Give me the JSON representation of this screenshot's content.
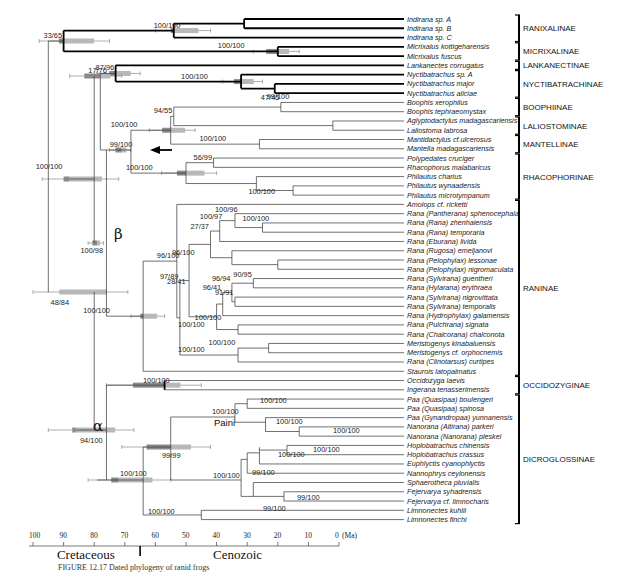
{
  "figure": {
    "caption_visible": "FIGURE 12.17  Dated phylogeny of ranid frogs",
    "axis": {
      "unit_label": "(Ma)",
      "ticks": [
        100,
        90,
        80,
        70,
        60,
        50,
        40,
        30,
        20,
        10,
        0
      ],
      "range_ma": [
        100,
        0
      ],
      "boundary_ma": 65,
      "eras": [
        {
          "name": "Cretaceous",
          "center_ma": 84
        },
        {
          "name": "Cenozoic",
          "center_ma": 33
        }
      ]
    },
    "colors": {
      "branch": "#333333",
      "bold_branch": "#000000",
      "hpd_bar": "#b8b8b8",
      "hpd_dark": "#8a8a8a",
      "whisker": "#999999"
    },
    "annotations": {
      "alpha": "α",
      "beta": "β",
      "paini": "Paini",
      "arrow": "left-arrow"
    },
    "taxa": [
      "Indirana sp. A",
      "Indirana sp. B",
      "Indirana sp. C",
      "Micrixalus kottigeharensis",
      "Micrixalus fuscus",
      "Lankanectes corrugatus",
      "Nyctibatrachus sp. A",
      "Nyctibatrachus major",
      "Nyctibatrachus aliciae",
      "Boophis xerophilus",
      "Boophis tephraeomystax",
      "Aglyptodactylus madagascariensis",
      "Laliostoma labrosa",
      "Mantidactylus cf.ulcerosus",
      "Mantella madagascariensis",
      "Polypedates cruciger",
      "Rhacophorus malabaricus",
      "Philautus charius",
      "Philautus wynaadensis",
      "Philautus microtympanum",
      "Amolops  cf. ricketti",
      "Rana (Pantherana) sphenocephala",
      "Rana (Rana) zhenhaiensis",
      "Rana (Rana) temporaria",
      "Rana (Eburana) livida",
      "Rana (Rugosa) emeljanovi",
      "Rana (Pelophylax) lessonae",
      "Rana (Pelophylax) nigromaculata",
      "Rana (Sylvirana) guentheri",
      "Rana (Hylarana) erythraea",
      "Rana (Sylvirana) nigrovittata",
      "Rana (Sylvirana) temporalis",
      "Rana (Hydrophylax) galamensis",
      "Rana (Pulchrana) signata",
      "Rana (Chalcorana) chalconota",
      "Meristogenys kinabaluensis",
      "Meristogenys cf. orphocnemis",
      "Rana (Clinotarsus) curtipes",
      "Staurois latopalmatus",
      "Occidozyga laevis",
      "Ingerana tenasserimensis",
      "Paa (Quasipaa) boulengeri",
      "Paa (Quasipaa) spinosa",
      "Paa (Gynandropaa) yunnanensis",
      "Nanorana (Altirana) parkeri",
      "Nanorana  (Nanorana) pleskei",
      "Hoplobatrachus chinensis",
      "Hoplobatrachus crassus",
      "Euphlyctis cyanophlyctis",
      "Nannophrys ceylonensis",
      "Sphaerotheca pluvialis",
      "Fejervarya syhadrensis",
      "Fejervarya  cf. limnocharis",
      "Limnonectes kuhlii",
      "Limnonectes finchi"
    ],
    "subfamilies": [
      {
        "name": "RANIXALINAE",
        "from": 0,
        "to": 2
      },
      {
        "name": "MICRIXALINAE",
        "from": 3,
        "to": 4
      },
      {
        "name": "LANKANECTINAE",
        "from": 5,
        "to": 5
      },
      {
        "name": "NYCTIBATRACHINAE",
        "from": 6,
        "to": 8
      },
      {
        "name": "BOOPHIINAE",
        "from": 9,
        "to": 10
      },
      {
        "name": "LALIOSTOMINAE",
        "from": 11,
        "to": 12
      },
      {
        "name": "MANTELLINAE",
        "from": 13,
        "to": 14
      },
      {
        "name": "RHACOPHORINAE",
        "from": 15,
        "to": 19
      },
      {
        "name": "RANINAE",
        "from": 20,
        "to": 38
      },
      {
        "name": "OCCIDOZYGINAE",
        "from": 39,
        "to": 40
      },
      {
        "name": "DICROGLOSSINAE",
        "from": 41,
        "to": 54
      }
    ],
    "nodes": [
      {
        "id": "root",
        "age": 95,
        "children": [
          "ranixMicr",
          "n_rest"
        ],
        "support": "",
        "hpd": [
          97,
          85
        ]
      },
      {
        "id": "ranixMicr",
        "age": 90,
        "children": [
          "ranix",
          "micr"
        ],
        "support": "33/65",
        "supPos": "above",
        "hpd": [
          98,
          75
        ],
        "bold": true
      },
      {
        "id": "ranix",
        "age": 54,
        "children": [
          "indAB",
          "t2"
        ],
        "support": "100/100",
        "supPos": "above",
        "hpd": [
          60,
          42
        ],
        "bold": true
      },
      {
        "id": "indAB",
        "age": 31,
        "children": [
          "t0",
          "t1"
        ],
        "support": "",
        "bold": true
      },
      {
        "id": "micr",
        "age": 20,
        "children": [
          "t3",
          "t4"
        ],
        "support": "100/100",
        "supPos": "aboveMid",
        "hpd": [
          28,
          13
        ],
        "bold": true
      },
      {
        "id": "n_rest",
        "age": 91,
        "children": [
          "n_a",
          "n_b"
        ],
        "support": "48/84",
        "supPos": "below",
        "hpd": [
          100,
          68
        ]
      },
      {
        "id": "n_a",
        "age": 88,
        "children": [
          "n_ln",
          "n_c"
        ],
        "support": "100/100",
        "supPos": "above",
        "hpd": [
          97,
          72
        ]
      },
      {
        "id": "n_ln",
        "age": 78,
        "children": [
          "lankNyct",
          "n_mr"
        ],
        "support": "17/76",
        "supPos": "above",
        "hpd": [
          88,
          71
        ]
      },
      {
        "id": "lankNyct",
        "age": 73,
        "children": [
          "t5",
          "nyct"
        ],
        "support": "87/96",
        "supPos": "above",
        "hpd": [
          79,
          65
        ],
        "bold": true
      },
      {
        "id": "nyct",
        "age": 32,
        "children": [
          "t6",
          "nyctMA"
        ],
        "support": "100/100",
        "supPos": "aboveMid",
        "hpd": [
          38,
          25
        ],
        "bold": true
      },
      {
        "id": "nyctMA",
        "age": 21,
        "children": [
          "t7",
          "t8"
        ],
        "support": "99/100",
        "supPos": "below",
        "bold": true
      },
      {
        "id": "n_mr",
        "age": 71,
        "children": [
          "mantRhac"
        ],
        "support": "99/100",
        "supPos": "above",
        "hpd": [
          75,
          68
        ]
      },
      {
        "id": "mantRhac",
        "age": 68,
        "children": [
          "mant",
          "rhac"
        ],
        "support": "",
        "arrow": true
      },
      {
        "id": "mant",
        "age": 55,
        "children": [
          "mant2",
          "mantMM"
        ],
        "support": "100/100",
        "supPos": "aboveMid",
        "hpd": [
          62,
          47
        ]
      },
      {
        "id": "mant2",
        "age": 54,
        "children": [
          "boo",
          "lal"
        ],
        "support": "94/55",
        "supPos": "above"
      },
      {
        "id": "boo",
        "age": 19,
        "children": [
          "t9",
          "t10"
        ],
        "support": "47/45",
        "supPos": "aboveLeft"
      },
      {
        "id": "lal",
        "age": 2,
        "children": [
          "t11",
          "t12"
        ],
        "support": ""
      },
      {
        "id": "mantMM",
        "age": 26,
        "children": [
          "t13",
          "t14"
        ],
        "support": "100/100",
        "supPos": "aboveMid"
      },
      {
        "id": "rhac",
        "age": 50,
        "children": [
          "rhacPR",
          "phil"
        ],
        "support": "100/100",
        "supPos": "aboveMid",
        "hpd": [
          58,
          40
        ]
      },
      {
        "id": "rhacPR",
        "age": 41,
        "children": [
          "t15",
          "t16"
        ],
        "support": "56/99",
        "supPos": "above"
      },
      {
        "id": "phil",
        "age": 27,
        "children": [
          "t17",
          "philWM"
        ],
        "support": "100/100",
        "supPos": "below"
      },
      {
        "id": "philWM",
        "age": 15,
        "children": [
          "t18",
          "t19"
        ],
        "support": ""
      },
      {
        "id": "n_c",
        "age": 79,
        "children": [
          "n_c2",
          "ranin"
        ],
        "support": "100/98",
        "supPos": "belowBeta",
        "hpd": [
          82,
          77
        ],
        "beta": true
      },
      {
        "id": "n_c2",
        "age": 76,
        "children": [
          "n_c3",
          "n_x"
        ],
        "support": ""
      },
      {
        "id": "n_c3",
        "age": 75,
        "children": [
          "ranini"
        ],
        "support": ""
      },
      {
        "id": "ranin",
        "age": 64,
        "children": [
          "raniMain",
          "t38"
        ],
        "support": "100/100",
        "supPos": "aboveMid",
        "hpd": [
          68,
          57
        ]
      },
      {
        "id": "raniMain",
        "age": 53,
        "children": [
          "t20",
          "r1"
        ],
        "support": "96/100",
        "supPos": "above"
      },
      {
        "id": "r1",
        "age": 52,
        "children": [
          "r2",
          "r3"
        ],
        "support": "97/89",
        "supPos": "aboveLeft"
      },
      {
        "id": "r2",
        "age": 49,
        "children": [
          "r4",
          "r5"
        ],
        "support": "28/41",
        "supPos": "belowLeft"
      },
      {
        "id": "r4",
        "age": 42,
        "children": [
          "r6",
          "r7"
        ],
        "support": "27/37",
        "supPos": "aboveLeft"
      },
      {
        "id": "r6",
        "age": 39,
        "children": [
          "r8",
          "t24"
        ],
        "support": "100/97",
        "supPos": "aboveLeft"
      },
      {
        "id": "r8",
        "age": 34,
        "children": [
          "t21",
          "r9"
        ],
        "support": "100/96",
        "supPos": "aboveLeft"
      },
      {
        "id": "r9",
        "age": 25,
        "children": [
          "t22",
          "t23"
        ],
        "support": "100/100",
        "supPos": "aboveLeft"
      },
      {
        "id": "r9b",
        "age": 15,
        "children": [],
        "support": "100/100"
      },
      {
        "id": "r7",
        "age": 35,
        "children": [
          "t25",
          "r10"
        ],
        "support": "96/100",
        "supPos": "aboveMid"
      },
      {
        "id": "r10",
        "age": 20,
        "children": [
          "t26",
          "t27"
        ],
        "support": ""
      },
      {
        "id": "r5",
        "age": 40,
        "children": [
          "r11",
          "r12"
        ],
        "support": "100/100",
        "supPos": "belowLeft"
      },
      {
        "id": "r11",
        "age": 38,
        "children": [
          "r13",
          "t32"
        ],
        "support": "96/41",
        "supPos": "aboveLeft"
      },
      {
        "id": "r13",
        "age": 35,
        "children": [
          "r14",
          "r15"
        ],
        "support": "96/94",
        "supPos": "aboveLeft"
      },
      {
        "id": "r14",
        "age": 28,
        "children": [
          "t28",
          "t29"
        ],
        "support": "90/95",
        "supPos": "aboveLeft"
      },
      {
        "id": "r15",
        "age": 34,
        "children": [
          "t30",
          "t31"
        ],
        "support": "91/91",
        "supPos": "aboveLeft"
      },
      {
        "id": "r12",
        "age": 33,
        "children": [
          "t33",
          "t34"
        ],
        "support": "100/100",
        "supPos": "aboveMid"
      },
      {
        "id": "r16",
        "age": 33,
        "children": [
          "r17",
          "t37"
        ],
        "support": "100/100",
        "supPos": "aboveMid"
      },
      {
        "id": "r17",
        "age": 23,
        "children": [
          "t35",
          "t36"
        ],
        "support": "100/100",
        "supPos": "aboveMid"
      }
    ],
    "dic": {
      "alpha_support": "94/100",
      "occid_support": "100/100",
      "dicro_support": "100/100",
      "paini_support": "99/99",
      "supports": [
        "100/100",
        "100/100",
        "100/100",
        "100/100",
        "100/100",
        "99/100",
        "100/100",
        "100/100",
        "99/100",
        "99/100",
        "100/100"
      ]
    }
  }
}
